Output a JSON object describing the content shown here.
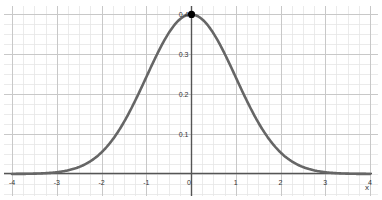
{
  "chart_data": {
    "type": "line",
    "title": "",
    "xlabel": "x",
    "ylabel": "",
    "xlim": [
      -4,
      4
    ],
    "ylim": [
      0,
      0.4
    ],
    "grid": true,
    "x_ticks": [
      -4,
      -3,
      -2,
      -1,
      0,
      1,
      2,
      3,
      4
    ],
    "x_tick_labels": [
      "-4",
      "-3",
      "-2",
      "-1",
      "0",
      "1",
      "2",
      "3",
      "4"
    ],
    "y_ticks": [
      0.1,
      0.2,
      0.3,
      0.4
    ],
    "y_tick_labels": [
      "0.1",
      "0.2",
      "0.3",
      "0.4"
    ],
    "series": [
      {
        "name": "standard normal density",
        "function": "exp(-x^2/2)/sqrt(2*pi)",
        "x": [
          -4,
          -3.5,
          -3,
          -2.5,
          -2,
          -1.5,
          -1,
          -0.5,
          0,
          0.5,
          1,
          1.5,
          2,
          2.5,
          3,
          3.5,
          4
        ],
        "values": [
          0.0001,
          0.0009,
          0.0044,
          0.0175,
          0.054,
          0.1295,
          0.242,
          0.3521,
          0.3989,
          0.3521,
          0.242,
          0.1295,
          0.054,
          0.0175,
          0.0044,
          0.0009,
          0.0001
        ],
        "color": "#666666"
      }
    ],
    "points": [
      {
        "label": "peak",
        "x": 0,
        "y": 0.3989,
        "color": "#000000"
      }
    ]
  },
  "colors": {
    "major_grid": "#c8c8c8",
    "minor_grid": "#e6e6e6",
    "axis": "#555555",
    "curve": "#666666"
  }
}
